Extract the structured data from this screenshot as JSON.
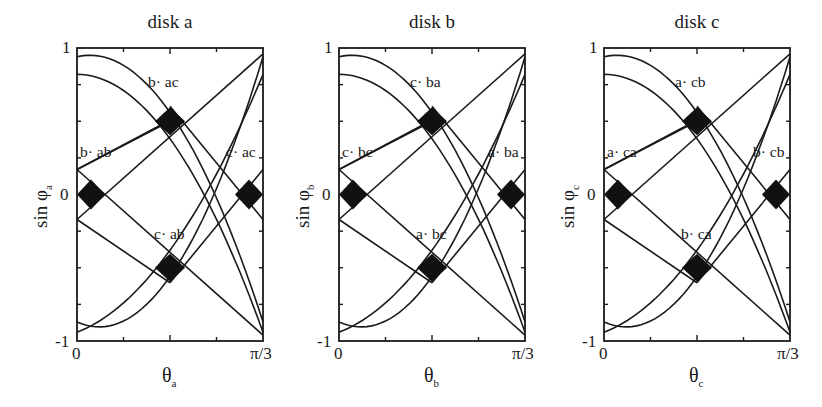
{
  "figure": {
    "panels": [
      {
        "title": "disk a",
        "ylabel_main": "sin φ",
        "ylabel_sub": "a",
        "xlabel_main": "θ",
        "xlabel_sub": "a",
        "annotations": {
          "top": "b· ac",
          "left": "b· ab",
          "right": "c· ac",
          "bottom": "c· ab"
        }
      },
      {
        "title": "disk b",
        "ylabel_main": "sin φ",
        "ylabel_sub": "b",
        "xlabel_main": "θ",
        "xlabel_sub": "b",
        "annotations": {
          "top": "c· ba",
          "left": "c· bc",
          "right": "a· ba",
          "bottom": "a· bc"
        }
      },
      {
        "title": "disk c",
        "ylabel_main": "sin φ",
        "ylabel_sub": "c",
        "xlabel_main": "θ",
        "xlabel_sub": "c",
        "annotations": {
          "top": "a· cb",
          "left": "a· ca",
          "right": "b· cb",
          "bottom": "b· ca"
        }
      }
    ],
    "ticks": {
      "y_top": "1",
      "y_mid": "0",
      "y_bottom": "-1",
      "x_left": "0",
      "x_right": "π/3"
    }
  },
  "chart_data": [
    {
      "type": "line",
      "title": "disk a",
      "xlabel": "θ_a",
      "ylabel": "sin φ_a",
      "xlim": [
        "0",
        "π/3"
      ],
      "ylim": [
        -1,
        1
      ],
      "x_ticks_fraction": [
        0,
        0.25,
        0.5,
        0.75,
        1
      ],
      "y_ticks": [
        -1,
        -0.75,
        -0.5,
        -0.25,
        0,
        0.25,
        0.5,
        0.75,
        1
      ],
      "grid": false,
      "series": [
        {
          "name": "descending-outer",
          "points": [
            [
              0,
              0.94
            ],
            [
              0.5,
              0.52
            ],
            [
              1,
              -0.87
            ]
          ]
        },
        {
          "name": "descending-inner",
          "points": [
            [
              0,
              0.82
            ],
            [
              0.5,
              0.33
            ],
            [
              1,
              -0.94
            ]
          ]
        },
        {
          "name": "ascending-outer",
          "points": [
            [
              0,
              -0.87
            ],
            [
              0.5,
              -0.52
            ],
            [
              1,
              0.94
            ]
          ]
        },
        {
          "name": "ascending-inner",
          "points": [
            [
              0,
              -0.94
            ],
            [
              0.5,
              -0.33
            ],
            [
              1,
              0.82
            ]
          ]
        }
      ],
      "filled_regions": [
        {
          "label": "b· ac",
          "center": [
            0.5,
            0.5
          ]
        },
        {
          "label": "b· ab",
          "center": [
            0.08,
            0
          ]
        },
        {
          "label": "c· ac",
          "center": [
            0.92,
            0
          ]
        },
        {
          "label": "c· ab",
          "center": [
            0.5,
            -0.5
          ]
        }
      ]
    },
    {
      "type": "line",
      "title": "disk b",
      "xlabel": "θ_b",
      "ylabel": "sin φ_b",
      "xlim": [
        "0",
        "π/3"
      ],
      "ylim": [
        -1,
        1
      ],
      "filled_regions": [
        {
          "label": "c· ba",
          "center": [
            0.5,
            0.5
          ]
        },
        {
          "label": "c· bc",
          "center": [
            0.08,
            0
          ]
        },
        {
          "label": "a· ba",
          "center": [
            0.92,
            0
          ]
        },
        {
          "label": "a· bc",
          "center": [
            0.5,
            -0.5
          ]
        }
      ]
    },
    {
      "type": "line",
      "title": "disk c",
      "xlabel": "θ_c",
      "ylabel": "sin φ_c",
      "xlim": [
        "0",
        "π/3"
      ],
      "ylim": [
        -1,
        1
      ],
      "filled_regions": [
        {
          "label": "a· cb",
          "center": [
            0.5,
            0.5
          ]
        },
        {
          "label": "a· ca",
          "center": [
            0.08,
            0
          ]
        },
        {
          "label": "b· cb",
          "center": [
            0.92,
            0
          ]
        },
        {
          "label": "b· ca",
          "center": [
            0.5,
            -0.5
          ]
        }
      ]
    }
  ]
}
